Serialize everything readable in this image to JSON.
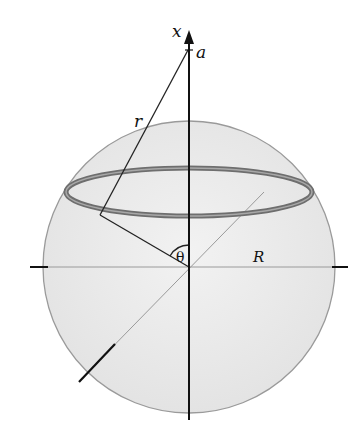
{
  "diagram": {
    "labels": {
      "x_axis": "x",
      "point": "a",
      "distance": "r",
      "angle": "θ",
      "radius": "R"
    },
    "colors": {
      "sphere_fill": "#e8e8e8",
      "sphere_edge": "#9a9a9a",
      "ring": "#6e6e6e",
      "axis": "#111111"
    }
  }
}
